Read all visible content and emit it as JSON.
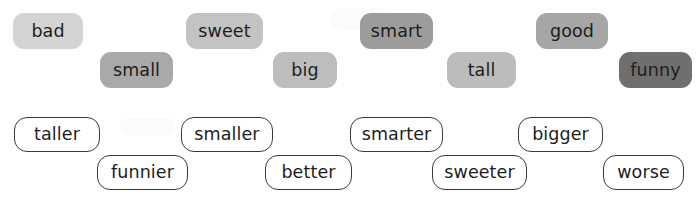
{
  "canvas": {
    "width": 696,
    "height": 200,
    "background": "#ffffff"
  },
  "adjectives": {
    "style": "filled-rounded-chip",
    "items": [
      {
        "label": "bad",
        "color": "#d4d4d4",
        "x": 13,
        "y": 13,
        "w": 70,
        "h": 36
      },
      {
        "label": "small",
        "color": "#a9a9a9",
        "x": 100,
        "y": 52,
        "w": 73,
        "h": 36
      },
      {
        "label": "sweet",
        "color": "#c3c3c3",
        "x": 186,
        "y": 13,
        "w": 77,
        "h": 36
      },
      {
        "label": "big",
        "color": "#bdbdbd",
        "x": 273,
        "y": 52,
        "w": 64,
        "h": 36
      },
      {
        "label": "smart",
        "color": "#9c9c9c",
        "x": 360,
        "y": 13,
        "w": 73,
        "h": 36
      },
      {
        "label": "tall",
        "color": "#bcbcbc",
        "x": 447,
        "y": 52,
        "w": 69,
        "h": 36
      },
      {
        "label": "good",
        "color": "#a6a6a6",
        "x": 536,
        "y": 13,
        "w": 72,
        "h": 36
      },
      {
        "label": "funny",
        "color": "#6f6f6f",
        "x": 619,
        "y": 52,
        "w": 73,
        "h": 36
      }
    ]
  },
  "comparatives": {
    "style": "outlined-rounded-chip",
    "border_color": "#3a3a3a",
    "fill_color": "#ffffff",
    "items": [
      {
        "label": "taller",
        "x": 14,
        "y": 117,
        "w": 86,
        "h": 35
      },
      {
        "label": "funnier",
        "x": 97,
        "y": 155,
        "w": 91,
        "h": 35
      },
      {
        "label": "smaller",
        "x": 181,
        "y": 117,
        "w": 92,
        "h": 35
      },
      {
        "label": "better",
        "x": 265,
        "y": 155,
        "w": 87,
        "h": 35
      },
      {
        "label": "smarter",
        "x": 350,
        "y": 117,
        "w": 93,
        "h": 35
      },
      {
        "label": "sweeter",
        "x": 432,
        "y": 155,
        "w": 95,
        "h": 35
      },
      {
        "label": "bigger",
        "x": 518,
        "y": 117,
        "w": 85,
        "h": 35
      },
      {
        "label": "worse",
        "x": 603,
        "y": 155,
        "w": 81,
        "h": 35
      }
    ]
  }
}
